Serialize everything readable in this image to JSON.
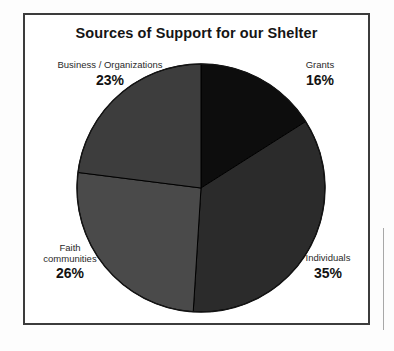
{
  "chart_data": {
    "type": "pie",
    "title": "Sources of Support for our Shelter",
    "categories": [
      "Grants",
      "Individuals",
      "Faith communities",
      "Business / Organizations"
    ],
    "values": [
      16,
      35,
      26,
      23
    ],
    "value_suffix": "%",
    "labels": [
      "16%",
      "35%",
      "26%",
      "23%"
    ],
    "colors": [
      "#0d0d0d",
      "#2b2b2b",
      "#4a4a4a",
      "#3d3d3d"
    ],
    "slice_order": "clockwise from 12 o'clock",
    "legend": "none",
    "labels_position": "outside corners",
    "grid": false,
    "start_angle_deg": 0
  },
  "frame": {
    "border_color": "#3c3c3c",
    "background": "#ffffff"
  },
  "title": {
    "text": "Sources of Support for our Shelter"
  },
  "slices": [
    {
      "key": "business",
      "name": "Business / Organizations",
      "percent": "23%",
      "value": 23,
      "color": "#3d3d3d"
    },
    {
      "key": "grants",
      "name": "Grants",
      "percent": "16%",
      "value": 16,
      "color": "#0d0d0d"
    },
    {
      "key": "individuals",
      "name": "Individuals",
      "percent": "35%",
      "value": 35,
      "color": "#2b2b2b"
    },
    {
      "key": "faith",
      "name_line1": "Faith",
      "name_line2": "communities",
      "name": "Faith communities",
      "percent": "26%",
      "value": 26,
      "color": "#4a4a4a"
    }
  ]
}
